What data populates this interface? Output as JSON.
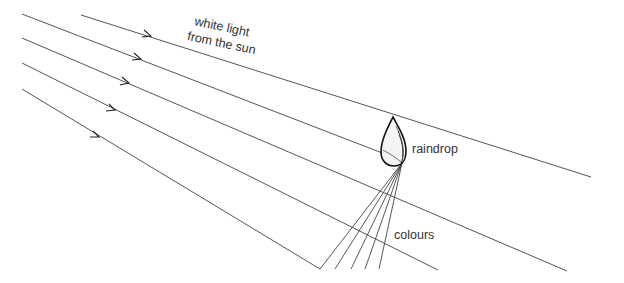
{
  "diagram": {
    "labels": {
      "sunlight_line1": "white light",
      "sunlight_line2": "from the sun",
      "raindrop": "raindrop",
      "colours": "colours"
    },
    "incoming_rays": [
      {
        "id": "ray-1",
        "passes": "above raindrop"
      },
      {
        "id": "ray-2",
        "passes": "enters raindrop"
      },
      {
        "id": "ray-3",
        "passes": "below raindrop"
      },
      {
        "id": "ray-4",
        "passes": "below raindrop"
      },
      {
        "id": "ray-5",
        "passes": "below raindrop"
      }
    ],
    "dispersed_ray_count": 5,
    "colors": {
      "ray": "#555555",
      "raindrop_outline": "#111111",
      "text": "#333333",
      "background": "#ffffff"
    }
  }
}
